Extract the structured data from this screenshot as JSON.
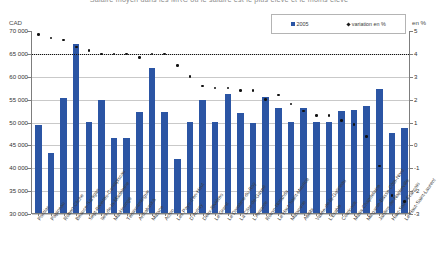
{
  "chart_title": "Salaire moyen dans les MRC où le salaire est le plus élevé et le moins élevé",
  "axis": {
    "left_unit": "CAD",
    "right_unit": "en %",
    "left_ticks": [
      "70 000",
      "65 000",
      "60 000",
      "55 000",
      "50 000",
      "45 000",
      "40 000",
      "35 000",
      "30 000"
    ],
    "right_ticks": [
      "5",
      "4",
      "3",
      "2",
      "1",
      "0",
      "-1",
      "-2",
      "-3"
    ],
    "left_min": 30000,
    "left_max": 70000,
    "right_min": -3,
    "right_max": 5
  },
  "legend": {
    "items": [
      {
        "label": "2005",
        "marker": "square-marker",
        "color": "#2b55a4"
      },
      {
        "label": "variation en %",
        "marker": "diamond-marker",
        "color": "#111111"
      }
    ]
  },
  "chart_data": {
    "type": "bar",
    "title": "Salaire moyen dans les MRC où le salaire est le plus élevé et le moins élevé",
    "xlabel": "",
    "ylabel": "CAD",
    "y2label": "en %",
    "ylim": [
      30000,
      70000
    ],
    "y2lim": [
      -3,
      5
    ],
    "grid": true,
    "legend_position": "top-right",
    "reference_line": {
      "value": 4,
      "axis": "right",
      "style": "dotted"
    },
    "categories": [
      "Pontiac",
      "Papineau",
      "Robert-Cliche",
      "Beauce-Sartigan",
      "Sept-Rivières-Caniapiscau",
      "Iles-de-la-Madeleine",
      "Maskinongé",
      "Témiscamingue",
      "Arthabaska",
      "Matane",
      "Acton",
      "Les Pays-d'en-Haut",
      "D'Autray",
      "Deux-Rivières",
      "Le Granit",
      "Le Domaine-du-Roy",
      "La Côte-de-Gaspé",
      "L'Amiante",
      "Rouyn-Noranda",
      "Le Haut-Saint-Maurice",
      "Matawinie",
      "Abitibi",
      "Vallée-de-la-Gatineau",
      "L'Érable",
      "Coaticook",
      "Maria-Chapdelaine",
      "Minganie-Basse-Côte-Nord",
      "Jardins-de-Napierville",
      "Haut-Saint-François",
      "Le Haut-Saint-Laurent"
    ],
    "series": [
      {
        "name": "2005",
        "axis": "left",
        "type": "bar",
        "color": "#2b55a4",
        "values": [
          49200,
          43200,
          55100,
          67000,
          50000,
          54700,
          46400,
          46400,
          52100,
          61700,
          52000,
          41800,
          50000,
          54800,
          50000,
          56000,
          51900,
          49600,
          55300,
          53000,
          50000,
          52900,
          50000,
          50000,
          52400,
          52500,
          53300,
          57000,
          47500,
          48600
        ]
      },
      {
        "name": "variation en %",
        "axis": "right",
        "type": "scatter",
        "color": "#111111",
        "values": [
          4.85,
          4.7,
          4.6,
          4.3,
          4.15,
          4.0,
          4.0,
          4.0,
          3.85,
          4.0,
          4.0,
          3.5,
          3.0,
          2.6,
          2.5,
          2.5,
          2.4,
          2.4,
          2.0,
          2.2,
          1.8,
          1.5,
          1.3,
          1.3,
          1.1,
          0.9,
          0.4,
          -0.9,
          -2.2,
          -2.45
        ]
      }
    ]
  }
}
